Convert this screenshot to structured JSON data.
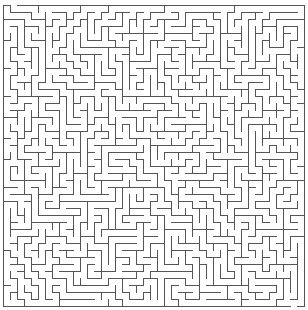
{
  "maze": {
    "title": "Maze",
    "cols": 43,
    "rows": 43,
    "cell_size": 7,
    "origin_x": 3,
    "origin_y": 5,
    "seed": 1337,
    "wall_color": "#555555",
    "background_color": "#ffffff",
    "wall_width": 1,
    "entrance": {
      "side": "top",
      "col": 1
    },
    "exit": {
      "side": "bottom",
      "col": 41
    }
  }
}
